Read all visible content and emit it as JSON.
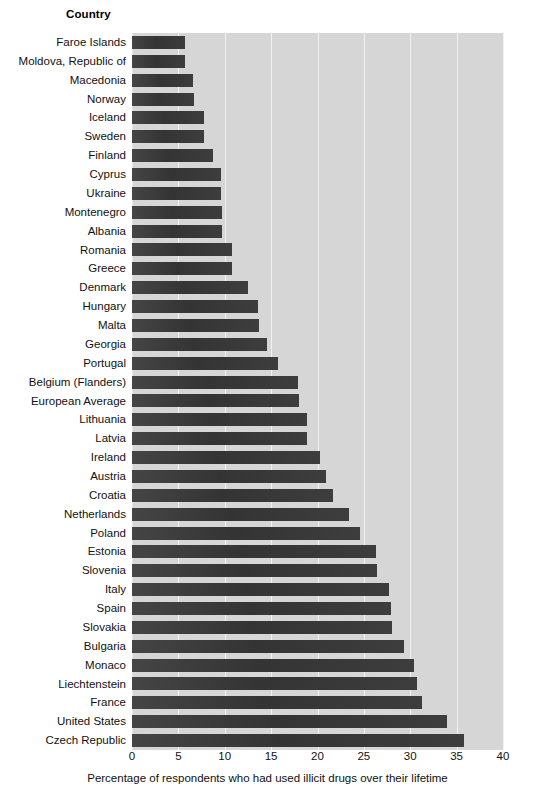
{
  "header": {
    "country_label": "Country"
  },
  "chart_data": {
    "type": "bar",
    "orientation": "horizontal",
    "title": "",
    "xlabel": "Percentage of respondents who had used illicit drugs over their lifetime",
    "ylabel": "Country",
    "xlim": [
      0,
      40
    ],
    "xticks": [
      0,
      5,
      10,
      15,
      20,
      25,
      30,
      35,
      40
    ],
    "grid": true,
    "legend": false,
    "plot_background": "#d6d6d6",
    "bar_color": "#3b3b3b",
    "gridline_color": "#f2f2f2",
    "categories": [
      "Faroe Islands",
      "Moldova, Republic of",
      "Macedonia",
      "Norway",
      "Iceland",
      "Sweden",
      "Finland",
      "Cyprus",
      "Ukraine",
      "Montenegro",
      "Albania",
      "Romania",
      "Greece",
      "Denmark",
      "Hungary",
      "Malta",
      "Georgia",
      "Portugal",
      "Belgium (Flanders)",
      "European Average",
      "Lithuania",
      "Latvia",
      "Ireland",
      "Austria",
      "Croatia",
      "Netherlands",
      "Poland",
      "Estonia",
      "Slovenia",
      "Italy",
      "Spain",
      "Slovakia",
      "Bulgaria",
      "Monaco",
      "Liechtenstein",
      "France",
      "United States",
      "Czech Republic"
    ],
    "values": [
      5.7,
      5.7,
      6.6,
      6.7,
      7.8,
      7.8,
      8.7,
      9.6,
      9.6,
      9.7,
      9.7,
      10.8,
      10.8,
      12.5,
      13.6,
      13.7,
      14.6,
      15.7,
      17.9,
      18.0,
      18.9,
      18.9,
      20.3,
      20.9,
      21.7,
      23.4,
      24.6,
      26.3,
      26.4,
      27.7,
      27.9,
      28.0,
      29.3,
      30.4,
      30.7,
      31.3,
      34.0,
      35.8
    ]
  }
}
